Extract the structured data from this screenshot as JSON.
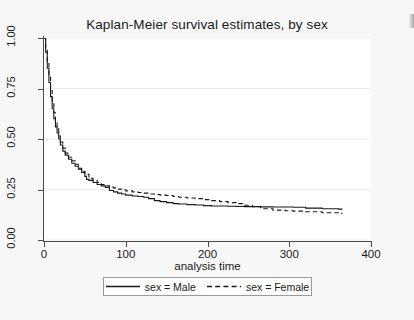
{
  "chart_data": {
    "type": "line",
    "title": "Kaplan-Meier survival estimates, by sex",
    "xlabel": "analysis time",
    "ylabel": "",
    "xlim": [
      0,
      400
    ],
    "ylim": [
      0,
      1
    ],
    "xticks": [
      "0",
      "100",
      "200",
      "300",
      "400"
    ],
    "yticks": [
      "0.00",
      "0.25",
      "0.50",
      "0.75",
      "1.00"
    ],
    "grid": true,
    "legend_position": "bottom",
    "series": [
      {
        "name": "sex = Male",
        "style": "solid",
        "color": "#1a1a1a",
        "x": [
          0,
          2,
          4,
          6,
          8,
          10,
          12,
          14,
          16,
          18,
          20,
          23,
          26,
          30,
          34,
          38,
          42,
          46,
          50,
          52,
          55,
          60,
          65,
          70,
          75,
          80,
          85,
          90,
          95,
          100,
          108,
          115,
          122,
          128,
          135,
          142,
          150,
          158,
          165,
          175,
          185,
          195,
          205,
          215,
          225,
          235,
          245,
          255,
          265,
          280,
          295,
          305,
          320,
          340,
          360,
          365
        ],
        "y": [
          1.0,
          0.93,
          0.85,
          0.78,
          0.71,
          0.65,
          0.6,
          0.56,
          0.53,
          0.5,
          0.47,
          0.44,
          0.42,
          0.4,
          0.38,
          0.365,
          0.35,
          0.335,
          0.315,
          0.3,
          0.295,
          0.285,
          0.275,
          0.268,
          0.26,
          0.245,
          0.238,
          0.232,
          0.228,
          0.222,
          0.218,
          0.215,
          0.212,
          0.205,
          0.195,
          0.19,
          0.185,
          0.18,
          0.178,
          0.175,
          0.173,
          0.17,
          0.168,
          0.168,
          0.167,
          0.166,
          0.165,
          0.165,
          0.164,
          0.163,
          0.163,
          0.162,
          0.158,
          0.155,
          0.153,
          0.153
        ]
      },
      {
        "name": "sex = Female",
        "style": "dashed",
        "color": "#1a1a1a",
        "x": [
          0,
          2,
          4,
          6,
          8,
          10,
          12,
          14,
          16,
          18,
          20,
          23,
          26,
          30,
          34,
          38,
          42,
          46,
          50,
          55,
          60,
          65,
          70,
          75,
          80,
          85,
          90,
          95,
          100,
          108,
          115,
          122,
          128,
          135,
          142,
          150,
          158,
          165,
          175,
          185,
          195,
          205,
          215,
          225,
          235,
          245,
          255,
          265,
          280,
          295,
          305,
          320,
          340,
          360,
          365
        ],
        "y": [
          1.0,
          0.95,
          0.88,
          0.81,
          0.74,
          0.68,
          0.63,
          0.59,
          0.55,
          0.515,
          0.485,
          0.455,
          0.43,
          0.41,
          0.392,
          0.375,
          0.355,
          0.34,
          0.325,
          0.305,
          0.295,
          0.285,
          0.275,
          0.268,
          0.262,
          0.258,
          0.252,
          0.248,
          0.243,
          0.238,
          0.235,
          0.232,
          0.228,
          0.225,
          0.222,
          0.22,
          0.215,
          0.212,
          0.208,
          0.205,
          0.2,
          0.195,
          0.19,
          0.185,
          0.18,
          0.172,
          0.165,
          0.155,
          0.148,
          0.145,
          0.143,
          0.14,
          0.135,
          0.132,
          0.132
        ]
      }
    ]
  },
  "legend": {
    "entries": [
      {
        "label": "sex = Male",
        "style": "solid"
      },
      {
        "label": "sex = Female",
        "style": "dashed"
      }
    ]
  }
}
